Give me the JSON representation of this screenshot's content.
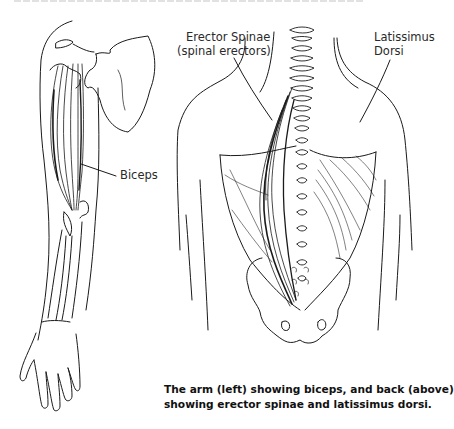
{
  "figure": {
    "left_panel": "arm",
    "right_panel": "back",
    "labels": {
      "biceps": "Biceps",
      "erector_line1": "Erector Spinae",
      "erector_line2": "(spinal erectors)",
      "latissimus_line1": "Latissimus",
      "latissimus_line2": "Dorsi"
    },
    "caption": {
      "line1": "The arm (left) showing biceps, and back (above)",
      "line2": "showing erector spinae and latissimus dorsi."
    }
  },
  "colors": {
    "ink": "#1a1a1a",
    "background": "#ffffff"
  }
}
